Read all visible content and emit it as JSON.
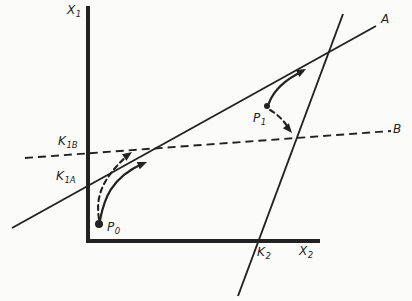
{
  "figure_title": "phase-diagram with lines A and B, points P0 and P1",
  "colors": {
    "background": "#fbfbf9",
    "ink": "#222222"
  },
  "axes": {
    "corner": [
      88,
      241
    ],
    "y_axis_top": 6,
    "x_axis_right": 320,
    "stroke_width": 4
  },
  "lines": [
    {
      "id": "A",
      "style": "solid",
      "from": [
        12,
        228
      ],
      "to": [
        376,
        26
      ],
      "width": 1.9
    },
    {
      "id": "B",
      "style": "dashed",
      "from": [
        25,
        158
      ],
      "to": [
        391,
        131
      ],
      "width": 1.9,
      "dash": "8 5"
    },
    {
      "id": "K2",
      "style": "solid",
      "from": [
        343,
        14
      ],
      "to": [
        238,
        296
      ],
      "width": 1.9
    }
  ],
  "points": [
    {
      "id": "P0",
      "x": 99,
      "y": 224,
      "r": 4
    },
    {
      "id": "P1",
      "x": 267,
      "y": 106,
      "r": 3
    }
  ],
  "trajectories": [
    {
      "id": "p0-solid",
      "style": "solid",
      "path": "M 100 220 C 104 200 110 178 144 163",
      "tip": [
        147,
        162
      ],
      "angle": -23,
      "width": 2.2
    },
    {
      "id": "p0-dashed",
      "style": "dashed",
      "path": "M 99 219 C 96 200 99 181 128 155",
      "tip": [
        132,
        152
      ],
      "angle": -35,
      "width": 2.1,
      "dash": "5 4"
    },
    {
      "id": "p1-solid",
      "style": "solid",
      "path": "M 269 103 Q 276 84 303 71",
      "tip": [
        306,
        69
      ],
      "angle": -28,
      "width": 2.2
    },
    {
      "id": "p1-dashed",
      "style": "dashed",
      "path": "M 270 110 Q 282 117 289 129",
      "tip": [
        292,
        133
      ],
      "angle": 50,
      "width": 2.1,
      "dash": "5 4"
    }
  ],
  "labels": {
    "x1": {
      "main": "X",
      "sub": "1"
    },
    "x2": {
      "main": "X",
      "sub": "2"
    },
    "k1b": {
      "main": "K",
      "sub": "1B"
    },
    "k1a": {
      "main": "K",
      "sub": "1A"
    },
    "k2": {
      "main": "K",
      "sub": "2"
    },
    "a": {
      "main": "A",
      "sub": ""
    },
    "b": {
      "main": "B",
      "sub": ""
    },
    "p0": {
      "main": "P",
      "sub": "0"
    },
    "p1": {
      "main": "P",
      "sub": "1"
    }
  }
}
